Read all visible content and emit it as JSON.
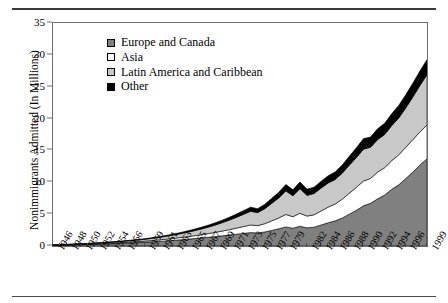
{
  "chart_data": {
    "type": "area",
    "stacked": true,
    "title": "",
    "xlabel": "",
    "ylabel": "Nonimmigrants Admitted (In Millions)",
    "ylim": [
      0,
      35
    ],
    "ytick_values": [
      0,
      5,
      10,
      15,
      20,
      25,
      30,
      35
    ],
    "ytick_labels": [
      "0",
      "5",
      "10",
      "15",
      "20",
      "25",
      "30",
      "35"
    ],
    "grid": false,
    "legend_position": "upper-left-inside",
    "x": [
      1946,
      1947,
      1948,
      1949,
      1950,
      1951,
      1952,
      1953,
      1954,
      1955,
      1956,
      1957,
      1958,
      1959,
      1960,
      1961,
      1962,
      1963,
      1964,
      1965,
      1966,
      1967,
      1968,
      1969,
      1970,
      1971,
      1972,
      1973,
      1974,
      1975,
      1976,
      1977,
      1978,
      1979,
      1980,
      1981,
      1982,
      1983,
      1984,
      1985,
      1986,
      1987,
      1988,
      1989,
      1990,
      1991,
      1992,
      1993,
      1994,
      1995,
      1996,
      1997,
      1998,
      1999
    ],
    "xtick_labels": [
      "1946",
      "1948",
      "1950",
      "1952",
      "1954",
      "1956",
      "1959",
      "1961",
      "1963",
      "1965",
      "1967",
      "1969",
      "1971",
      "1973",
      "1975",
      "1977",
      "1979",
      "1982",
      "1984",
      "1986",
      "1988",
      "1990",
      "1992",
      "1994",
      "1996",
      "1999"
    ],
    "series": [
      {
        "name": "Europe and Canada",
        "color": "#808080",
        "values": [
          0.1,
          0.12,
          0.15,
          0.18,
          0.21,
          0.24,
          0.27,
          0.3,
          0.34,
          0.38,
          0.43,
          0.48,
          0.53,
          0.58,
          0.65,
          0.72,
          0.8,
          0.88,
          0.97,
          1.06,
          1.16,
          1.26,
          1.37,
          1.48,
          1.6,
          1.72,
          1.85,
          1.98,
          2.1,
          2.05,
          2.2,
          2.45,
          2.7,
          3.0,
          2.8,
          3.1,
          2.85,
          2.95,
          3.3,
          3.65,
          3.95,
          4.4,
          5.0,
          5.6,
          6.3,
          6.7,
          7.4,
          8.0,
          8.9,
          9.6,
          10.6,
          11.6,
          12.7,
          13.7
        ]
      },
      {
        "name": "Asia",
        "color": "#ffffff",
        "values": [
          0.02,
          0.03,
          0.03,
          0.04,
          0.05,
          0.06,
          0.07,
          0.08,
          0.09,
          0.1,
          0.12,
          0.14,
          0.16,
          0.18,
          0.21,
          0.24,
          0.27,
          0.31,
          0.35,
          0.4,
          0.45,
          0.51,
          0.58,
          0.66,
          0.75,
          0.85,
          0.96,
          1.08,
          1.2,
          1.15,
          1.3,
          1.5,
          1.7,
          1.95,
          1.8,
          2.05,
          1.85,
          1.95,
          2.2,
          2.45,
          2.65,
          2.95,
          3.3,
          3.6,
          3.9,
          3.9,
          4.2,
          4.3,
          4.5,
          4.7,
          4.9,
          5.1,
          5.2,
          5.3
        ]
      },
      {
        "name": "Latin America and Caribbean",
        "color": "#c8c8c8",
        "values": [
          0.03,
          0.04,
          0.05,
          0.06,
          0.07,
          0.08,
          0.1,
          0.12,
          0.14,
          0.16,
          0.19,
          0.22,
          0.25,
          0.29,
          0.34,
          0.39,
          0.45,
          0.52,
          0.6,
          0.69,
          0.79,
          0.9,
          1.02,
          1.16,
          1.32,
          1.5,
          1.7,
          1.92,
          2.15,
          2.05,
          2.35,
          2.75,
          3.15,
          3.7,
          3.3,
          3.85,
          3.25,
          3.35,
          3.6,
          3.8,
          3.85,
          4.1,
          4.4,
          4.7,
          5.0,
          4.9,
          5.1,
          5.2,
          5.5,
          5.8,
          6.2,
          6.7,
          7.3,
          7.9
        ]
      },
      {
        "name": "Other",
        "color": "#000000",
        "values": [
          0.01,
          0.01,
          0.02,
          0.02,
          0.02,
          0.03,
          0.03,
          0.04,
          0.04,
          0.05,
          0.06,
          0.07,
          0.08,
          0.09,
          0.1,
          0.12,
          0.13,
          0.15,
          0.17,
          0.2,
          0.23,
          0.26,
          0.3,
          0.34,
          0.39,
          0.44,
          0.5,
          0.57,
          0.63,
          0.6,
          0.68,
          0.78,
          0.88,
          1.0,
          0.92,
          1.05,
          0.95,
          0.98,
          1.05,
          1.12,
          1.18,
          1.28,
          1.4,
          1.52,
          1.65,
          1.6,
          1.7,
          1.75,
          1.85,
          1.95,
          2.05,
          2.15,
          2.25,
          2.35
        ]
      }
    ]
  },
  "y_axis": {
    "title": "Nonimmigrants Admitted (In Millions)"
  },
  "legend": {
    "items": [
      {
        "label": "Europe and Canada",
        "color": "#808080"
      },
      {
        "label": "Asia",
        "color": "#ffffff"
      },
      {
        "label": "Latin America and Caribbean",
        "color": "#c8c8c8"
      },
      {
        "label": "Other",
        "color": "#000000"
      }
    ]
  }
}
